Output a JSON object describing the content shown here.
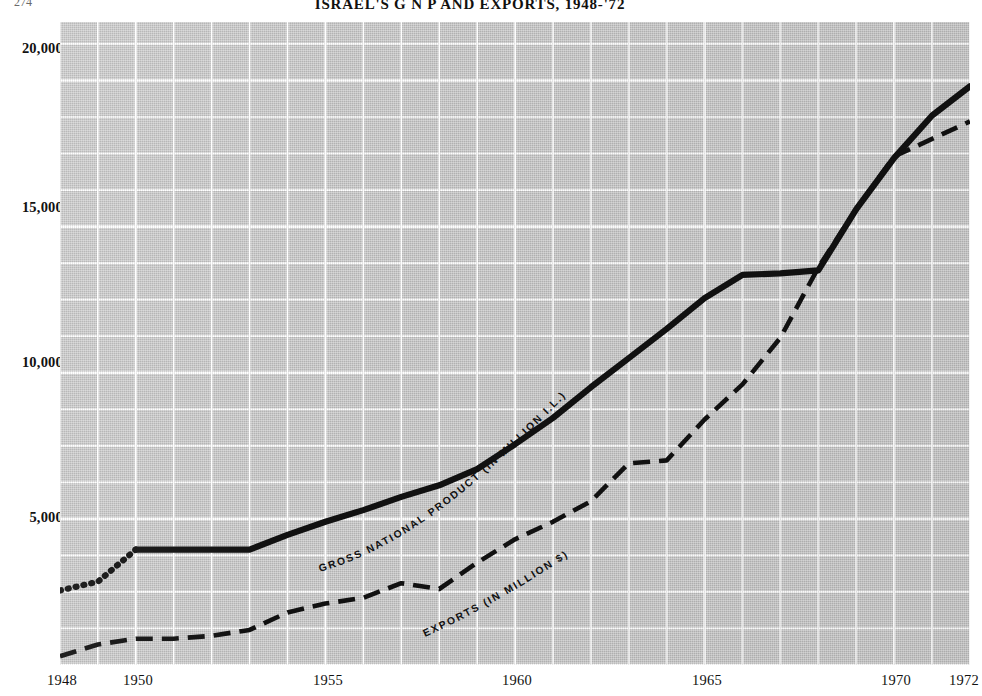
{
  "figure": {
    "title": "ISRAEL'S G N P AND EXPORTS, 1948-'72",
    "folio": "274",
    "background_color": "#c6c6c6",
    "ink_color": "#111111",
    "grid_color": "#ffffff"
  },
  "axes": {
    "left": {
      "label": "",
      "ticks": [
        "20,000",
        "15,000",
        "10,000",
        "5,000"
      ],
      "tick_values": [
        20000,
        15000,
        10000,
        5000
      ],
      "range": [
        0,
        22000
      ]
    },
    "right": {
      "label": "",
      "ticks": [
        "1000",
        "750",
        "500",
        "250"
      ],
      "tick_values": [
        1000,
        750,
        500,
        250
      ],
      "range": [
        0,
        1100
      ]
    },
    "bottom": {
      "ticks": [
        "1948",
        "1950",
        "1955",
        "1960",
        "1965",
        "1970",
        "1972"
      ],
      "tick_values": [
        1948,
        1950,
        1955,
        1960,
        1965,
        1970,
        1972
      ],
      "range": [
        1948,
        1972
      ]
    }
  },
  "series_labels": {
    "gnp": "GROSS  NATIONAL  PRODUCT  (IN  MILLION  I.L.)",
    "exports": "EXPORTS  (IN  MILLION  $)"
  },
  "chart_data": {
    "type": "line",
    "title": "ISRAEL'S G N P AND EXPORTS, 1948-'72",
    "xlabel": "",
    "ylabel": "",
    "grid": true,
    "legend_position": "inline-on-curve",
    "x": [
      1948,
      1949,
      1950,
      1951,
      1952,
      1953,
      1954,
      1955,
      1956,
      1957,
      1958,
      1959,
      1960,
      1961,
      1962,
      1963,
      1964,
      1965,
      1966,
      1967,
      1968,
      1969,
      1970,
      1971,
      1972
    ],
    "xlim": [
      1948,
      1972
    ],
    "series": [
      {
        "name": "GROSS NATIONAL PRODUCT (IN MILLION I.L.)",
        "unit": "million I.L.",
        "axis": "left",
        "ylim": [
          0,
          22000
        ],
        "style": "solid",
        "dotted_segment_years": [
          1948,
          1949,
          1950
        ],
        "values": [
          2550,
          2850,
          3950,
          3950,
          3950,
          3950,
          4450,
          4900,
          5300,
          5750,
          6150,
          6700,
          7550,
          8450,
          9500,
          10500,
          11500,
          12550,
          13350,
          13400,
          13500,
          15600,
          17350,
          18800,
          19800
        ]
      },
      {
        "name": "EXPORTS (IN MILLION $)",
        "unit": "million $",
        "axis": "right",
        "ylim": [
          0,
          1100
        ],
        "style": "dashed",
        "values": [
          15,
          35,
          45,
          45,
          50,
          60,
          90,
          105,
          115,
          140,
          130,
          175,
          215,
          245,
          280,
          345,
          350,
          420,
          480,
          560,
          680,
          780,
          870,
          900,
          930
        ]
      }
    ]
  }
}
